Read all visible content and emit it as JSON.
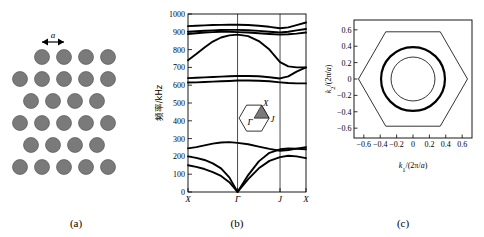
{
  "figure": {
    "panels": [
      {
        "id": "a",
        "label": "(a)"
      },
      {
        "id": "b",
        "label": "(b)"
      },
      {
        "id": "c",
        "label": "(c)"
      }
    ]
  },
  "panel_a": {
    "label": "(a)",
    "lattice_constant_symbol": "a",
    "circle_color": "#7a7a7a",
    "circle_stroke": "#4a4a4a",
    "rows": [
      {
        "y": 57,
        "xs": [
          42,
          64,
          86,
          108
        ]
      },
      {
        "y": 79,
        "xs": [
          20,
          42,
          64,
          86,
          108
        ]
      },
      {
        "y": 101,
        "xs": [
          31,
          53,
          75,
          97
        ]
      },
      {
        "y": 123,
        "xs": [
          20,
          42,
          64,
          86,
          108
        ]
      },
      {
        "y": 145,
        "xs": [
          31,
          53,
          75,
          97
        ]
      },
      {
        "y": 167,
        "xs": [
          20,
          42,
          64,
          86,
          108
        ]
      }
    ],
    "circle_radius": 7.5,
    "arrow": {
      "x1": 42,
      "x2": 64,
      "y": 42,
      "label": "a"
    }
  },
  "panel_b": {
    "label": "(b)",
    "ylabel": "频率/kHz",
    "yticks": [
      0,
      100,
      200,
      300,
      400,
      500,
      600,
      700,
      800,
      900,
      1000
    ],
    "ylim": [
      0,
      1000
    ],
    "xticks": [
      "X",
      "Γ",
      "J",
      "X"
    ],
    "xtick_positions": [
      0,
      0.42,
      0.78,
      1.0
    ],
    "inset": {
      "points": [
        {
          "name": "Γ",
          "pos": "center"
        },
        {
          "name": "X",
          "pos": "upper-right-vertex"
        },
        {
          "name": "J",
          "pos": "lower-right"
        }
      ],
      "shade_color": "#7a7a7a"
    }
  },
  "panel_c": {
    "label": "(c)",
    "xlabel": "k₁/(2π/a)",
    "ylabel": "k₂/(2π/a)",
    "xticks": [
      -0.6,
      -0.4,
      -0.2,
      0,
      0.2,
      0.4,
      0.6
    ],
    "yticks": [
      -0.6,
      -0.4,
      -0.2,
      0,
      0.2,
      0.4,
      0.6
    ],
    "xlim": [
      -0.72,
      0.72
    ],
    "ylim": [
      -0.72,
      0.72
    ],
    "hexagon_vertex_radius": 0.665,
    "circles": [
      {
        "radius": 0.39,
        "stroke_width": 2.2,
        "kind": "outer-thick"
      },
      {
        "radius": 0.268,
        "stroke_width": 0.8,
        "kind": "inner-thin"
      }
    ]
  },
  "chart_data": [
    {
      "type": "line",
      "panel": "b",
      "title": "",
      "xlabel": "",
      "ylabel": "频率/kHz",
      "ylim": [
        0,
        1000
      ],
      "grid": false,
      "x_symmetry_points": [
        "X",
        "Γ",
        "J",
        "X"
      ],
      "x_symmetry_positions": [
        0.0,
        0.42,
        0.78,
        1.0
      ],
      "series": [
        {
          "name": "acoustic-1",
          "x": [
            0.0,
            0.07,
            0.14,
            0.21,
            0.28,
            0.35,
            0.42,
            0.51,
            0.6,
            0.69,
            0.78,
            0.85,
            0.92,
            1.0
          ],
          "values": [
            150,
            141,
            129,
            112,
            90,
            55,
            0,
            72,
            133,
            175,
            196,
            204,
            200,
            190
          ]
        },
        {
          "name": "acoustic-2",
          "x": [
            0.0,
            0.07,
            0.14,
            0.21,
            0.28,
            0.35,
            0.42,
            0.51,
            0.6,
            0.69,
            0.78,
            0.85,
            0.92,
            1.0
          ],
          "values": [
            200,
            192,
            180,
            161,
            133,
            82,
            0,
            95,
            172,
            220,
            240,
            244,
            243,
            240
          ]
        },
        {
          "name": "acoustic-3",
          "x": [
            0.0,
            0.07,
            0.14,
            0.21,
            0.28,
            0.35,
            0.42,
            0.51,
            0.6,
            0.69,
            0.78,
            0.85,
            0.92,
            1.0
          ],
          "values": [
            245,
            252,
            262,
            272,
            278,
            280,
            276,
            268,
            255,
            242,
            232,
            236,
            244,
            252
          ]
        },
        {
          "name": "optical-1",
          "x": [
            0.0,
            0.07,
            0.14,
            0.21,
            0.28,
            0.35,
            0.42,
            0.51,
            0.6,
            0.69,
            0.78,
            0.85,
            0.92,
            1.0
          ],
          "values": [
            615,
            616,
            618,
            620,
            622,
            624,
            626,
            626,
            625,
            622,
            616,
            612,
            610,
            610
          ]
        },
        {
          "name": "optical-2",
          "x": [
            0.0,
            0.07,
            0.14,
            0.21,
            0.28,
            0.35,
            0.42,
            0.51,
            0.6,
            0.69,
            0.78,
            0.85,
            0.92,
            1.0
          ],
          "values": [
            640,
            642,
            644,
            646,
            648,
            650,
            652,
            652,
            650,
            645,
            638,
            650,
            676,
            700
          ]
        },
        {
          "name": "optical-3",
          "x": [
            0.0,
            0.07,
            0.14,
            0.21,
            0.28,
            0.35,
            0.42,
            0.51,
            0.6,
            0.69,
            0.78,
            0.85,
            0.92,
            1.0
          ],
          "values": [
            740,
            775,
            812,
            845,
            868,
            880,
            884,
            876,
            848,
            800,
            730,
            706,
            700,
            700
          ]
        },
        {
          "name": "optical-4",
          "x": [
            0.0,
            0.07,
            0.14,
            0.21,
            0.28,
            0.35,
            0.42,
            0.51,
            0.6,
            0.69,
            0.78,
            0.85,
            0.92,
            1.0
          ],
          "values": [
            888,
            892,
            896,
            898,
            900,
            900,
            898,
            896,
            892,
            888,
            884,
            886,
            890,
            896
          ]
        },
        {
          "name": "optical-5",
          "x": [
            0.0,
            0.07,
            0.14,
            0.21,
            0.28,
            0.35,
            0.42,
            0.51,
            0.6,
            0.69,
            0.78,
            0.85,
            0.92,
            1.0
          ],
          "values": [
            900,
            903,
            906,
            908,
            910,
            911,
            911,
            909,
            905,
            900,
            896,
            900,
            908,
            916
          ]
        },
        {
          "name": "optical-6",
          "x": [
            0.0,
            0.07,
            0.14,
            0.21,
            0.28,
            0.35,
            0.42,
            0.51,
            0.6,
            0.69,
            0.78,
            0.85,
            0.92,
            1.0
          ],
          "values": [
            932,
            934,
            936,
            938,
            939,
            940,
            940,
            938,
            934,
            928,
            920,
            925,
            938,
            952
          ]
        }
      ]
    },
    {
      "type": "line",
      "panel": "c",
      "title": "",
      "xlabel": "k₁/(2π/a)",
      "ylabel": "k₂/(2π/a)",
      "xlim": [
        -0.72,
        0.72
      ],
      "ylim": [
        -0.72,
        0.72
      ],
      "grid": false,
      "contours": [
        {
          "name": "brillouin-zone-hexagon",
          "shape": "hexagon",
          "vertex_radius": 0.665,
          "stroke_width": 0.8
        },
        {
          "name": "equifrequency-outer",
          "shape": "circle",
          "radius": 0.39,
          "stroke_width": 2.2
        },
        {
          "name": "equifrequency-inner",
          "shape": "circle",
          "radius": 0.268,
          "stroke_width": 0.8
        }
      ]
    }
  ]
}
